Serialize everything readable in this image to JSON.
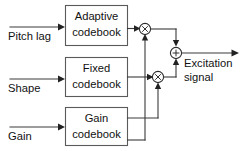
{
  "diagram": {
    "background_color": "#ffffff",
    "line_color": "#3a3a3a",
    "box_border_color": "#5a5a5a",
    "text_color": "#111111",
    "blocks": [
      {
        "id": "adaptive-codebook",
        "line1": "Adaptive",
        "line2": "codebook"
      },
      {
        "id": "fixed-codebook",
        "line1": "Fixed",
        "line2": "codebook"
      },
      {
        "id": "gain-codebook",
        "line1": "Gain",
        "line2": "codebook"
      }
    ],
    "inputs": [
      {
        "id": "pitch-lag",
        "label": "Pitch lag"
      },
      {
        "id": "shape",
        "label": "Shape"
      },
      {
        "id": "gain",
        "label": "Gain"
      }
    ],
    "operators": [
      {
        "id": "multiplier-top",
        "symbol": "×",
        "name": "multiply"
      },
      {
        "id": "multiplier-mid",
        "symbol": "×",
        "name": "multiply"
      },
      {
        "id": "summer",
        "symbol": "+",
        "name": "add"
      }
    ],
    "output": {
      "id": "excitation-signal",
      "line1": "Excitation",
      "line2": "signal"
    }
  }
}
